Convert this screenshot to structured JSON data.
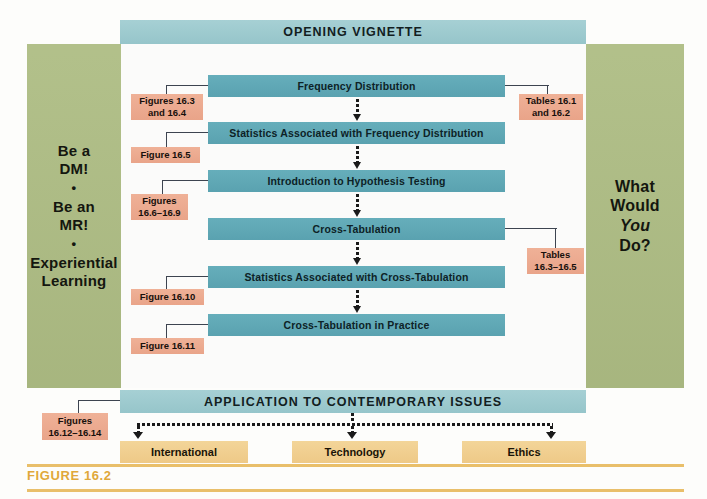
{
  "figure": {
    "caption": "FIGURE 16.2",
    "rule_color": "#e9bf6a",
    "caption_color": "#e0a83a"
  },
  "colors": {
    "panel_green": "#aebd84",
    "band_teal": "#9ccbd0",
    "process_teal": "#5fa8b6",
    "callout_salmon": "#edab90",
    "bottom_yellow": "#f0ce8e",
    "connector": "#3d4450",
    "arrow": "#1a1a1a"
  },
  "bands": {
    "opening": "OPENING VIGNETTE",
    "application": "APPLICATION TO CONTEMPORARY ISSUES"
  },
  "left_panel": {
    "line1": "Be a",
    "line2": "DM!",
    "sep1": "•",
    "line3": "Be an",
    "line4": "MR!",
    "sep2": "•",
    "line5": "Experiential",
    "line6": "Learning"
  },
  "right_panel": {
    "line1": "What",
    "line2": "Would",
    "line3_italic": "You",
    "line4": "Do?"
  },
  "process_steps": [
    {
      "label": "Frequency Distribution"
    },
    {
      "label": "Statistics Associated with Frequency Distribution"
    },
    {
      "label": "Introduction to Hypothesis Testing"
    },
    {
      "label": "Cross-Tabulation"
    },
    {
      "label": "Statistics Associated with Cross-Tabulation"
    },
    {
      "label": "Cross-Tabulation in Practice"
    }
  ],
  "callouts_left": [
    {
      "line1": "Figures 16.3",
      "line2": "and 16.4"
    },
    {
      "line1": "Figure 16.5",
      "line2": ""
    },
    {
      "line1": "Figures",
      "line2": "16.6–16.9"
    },
    {
      "line1": "Figure 16.10",
      "line2": ""
    },
    {
      "line1": "Figure 16.11",
      "line2": ""
    }
  ],
  "callouts_right": [
    {
      "line1": "Tables 16.1",
      "line2": "and 16.2"
    },
    {
      "line1": "Tables",
      "line2": "16.3–16.5"
    }
  ],
  "callout_bottom": {
    "line1": "Figures",
    "line2": "16.12–16.14"
  },
  "bottom_boxes": [
    {
      "label": "International"
    },
    {
      "label": "Technology"
    },
    {
      "label": "Ethics"
    }
  ]
}
